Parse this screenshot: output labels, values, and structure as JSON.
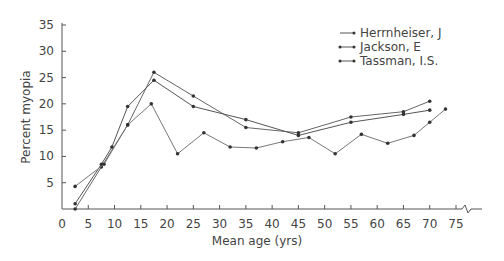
{
  "chart_data": {
    "type": "line",
    "title": "",
    "xlabel": "Mean age (yrs)",
    "ylabel": "Percent myopia",
    "xlim": [
      0,
      75
    ],
    "ylim": [
      0,
      35
    ],
    "x_ticks": [
      0,
      5,
      10,
      15,
      20,
      25,
      30,
      35,
      40,
      45,
      50,
      55,
      60,
      65,
      70,
      75
    ],
    "y_ticks": [
      5,
      10,
      15,
      20,
      25,
      30,
      35
    ],
    "grid": false,
    "legend_position": "top-right",
    "series": [
      {
        "name": "Herrnheiser, J",
        "points": [
          [
            2.5,
            0
          ],
          [
            7.5,
            8
          ],
          [
            12.5,
            16
          ],
          [
            17.5,
            26
          ],
          [
            25,
            21.5
          ],
          [
            35,
            15.5
          ],
          [
            45,
            14.5
          ],
          [
            55,
            17.5
          ],
          [
            65,
            18.5
          ],
          [
            70,
            20.5
          ]
        ]
      },
      {
        "name": "Jackson, E",
        "points": [
          [
            2.5,
            1
          ],
          [
            7.5,
            8.5
          ],
          [
            9.5,
            11.8
          ],
          [
            12.5,
            19.5
          ],
          [
            17.5,
            24.5
          ],
          [
            25,
            19.5
          ],
          [
            35,
            17
          ],
          [
            45,
            14
          ],
          [
            55,
            16.5
          ],
          [
            65,
            18
          ],
          [
            70,
            18.8
          ]
        ]
      },
      {
        "name": "Tassman, I.S.",
        "points": [
          [
            2.5,
            4.3
          ],
          [
            8,
            8.5
          ],
          [
            12.5,
            16
          ],
          [
            17,
            20
          ],
          [
            22,
            10.5
          ],
          [
            27,
            14.5
          ],
          [
            32,
            11.8
          ],
          [
            37,
            11.6
          ],
          [
            42,
            12.8
          ],
          [
            47,
            13.6
          ],
          [
            52,
            10.5
          ],
          [
            57,
            14.2
          ],
          [
            62,
            12.5
          ],
          [
            67,
            14
          ],
          [
            70,
            16.5
          ],
          [
            73,
            19
          ]
        ]
      }
    ]
  },
  "legend": {
    "items": [
      "Herrnheiser, J",
      "Jackson, E",
      "Tassman, I.S."
    ]
  },
  "axes": {
    "x_title": "Mean age (yrs)",
    "y_title": "Percent myopia"
  }
}
